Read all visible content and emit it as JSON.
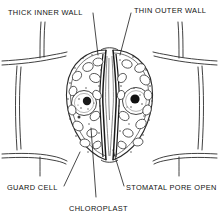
{
  "figure": {
    "kind": "biology-line-diagram",
    "style": "black ink line drawing on white, stippled organelles",
    "colors": {
      "background": "#ffffff",
      "ink": "#1a1a1a",
      "light_ink": "#555555",
      "nucleolus": "#111111"
    },
    "labels": {
      "thick_inner_wall": "THICK INNER WALL",
      "thin_outer_wall": "THIN OUTER WALL",
      "guard_cell": "GUARD CELL",
      "chloroplast": "CHLOROPLAST",
      "stomatal_pore_open": "STOMATAL PORE OPEN"
    },
    "parts": [
      "epidermal cell wall",
      "guard cell (left)",
      "guard cell (right)",
      "nucleus",
      "nucleolus",
      "chloroplast",
      "stomatal pore"
    ]
  }
}
